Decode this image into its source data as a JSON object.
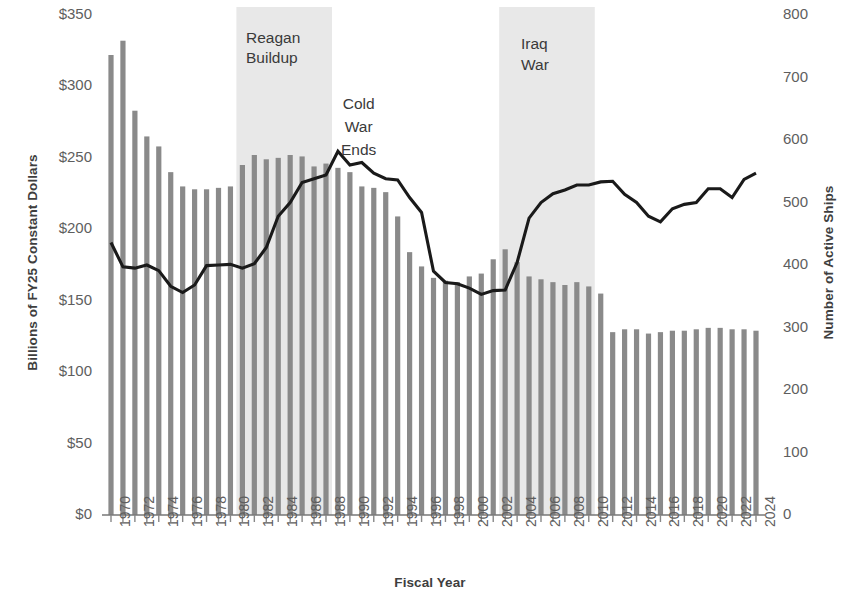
{
  "chart_data": {
    "type": "bar",
    "title": "",
    "xlabel": "Fiscal Year",
    "ylabel": "Billions of FY25 Constant Dollars",
    "ylabel_right": "Number of Active Ships",
    "ylim": [
      0,
      350
    ],
    "ylim_right": [
      0,
      800
    ],
    "ytick_labels": [
      "$0",
      "$50",
      "$100",
      "$150",
      "$200",
      "$250",
      "$300",
      "$350"
    ],
    "ytick_values": [
      0,
      50,
      100,
      150,
      200,
      250,
      300,
      350
    ],
    "ytick_right_labels": [
      "0",
      "100",
      "200",
      "300",
      "400",
      "500",
      "600",
      "700",
      "800"
    ],
    "ytick_right_values": [
      0,
      100,
      200,
      300,
      400,
      500,
      600,
      700,
      800
    ],
    "grid": false,
    "legend_position": "none",
    "categories": [
      1970,
      1971,
      1972,
      1973,
      1974,
      1975,
      1976,
      1977,
      1978,
      1979,
      1980,
      1981,
      1982,
      1983,
      1984,
      1985,
      1986,
      1987,
      1988,
      1989,
      1990,
      1991,
      1992,
      1993,
      1994,
      1995,
      1996,
      1997,
      1998,
      1999,
      2000,
      2001,
      2002,
      2003,
      2004,
      2005,
      2006,
      2007,
      2008,
      2009,
      2010,
      2011,
      2012,
      2013,
      2014,
      2015,
      2016,
      2017,
      2018,
      2019,
      2020,
      2021,
      2022,
      2023,
      2024
    ],
    "xtick_labels": [
      "1970",
      "1972",
      "1974",
      "1976",
      "1978",
      "1980",
      "1982",
      "1984",
      "1986",
      "1988",
      "1990",
      "1992",
      "1994",
      "1996",
      "1998",
      "2000",
      "2002",
      "2004",
      "2006",
      "2008",
      "2010",
      "2012",
      "2014",
      "2016",
      "2018",
      "2020",
      "2022",
      "2024"
    ],
    "series": [
      {
        "name": "Budget",
        "type": "bar",
        "axis": "left",
        "unit": "Billions of FY25 Constant Dollars",
        "color": "#8a8a8a",
        "values": [
          322,
          332,
          283,
          265,
          258,
          240,
          230,
          228,
          228,
          229,
          230,
          245,
          252,
          249,
          250,
          252,
          251,
          244,
          246,
          243,
          240,
          230,
          229,
          226,
          209,
          184,
          174,
          166,
          164,
          163,
          167,
          169,
          179,
          186,
          177,
          167,
          165,
          163,
          161,
          163,
          160,
          155,
          128,
          130,
          130,
          127,
          128,
          129,
          129,
          130,
          131,
          131,
          130,
          130,
          129
        ]
      },
      {
        "name": "Active Ships",
        "type": "line",
        "axis": "right",
        "unit": "Number of Active Ships",
        "color": "#1a1a1a",
        "values": [
          436,
          397,
          395,
          400,
          391,
          366,
          356,
          368,
          399,
          400,
          401,
          395,
          402,
          428,
          478,
          500,
          532,
          538,
          544,
          582,
          560,
          564,
          547,
          538,
          536,
          508,
          484,
          390,
          372,
          370,
          363,
          353,
          359,
          360,
          404,
          475,
          500,
          514,
          520,
          528,
          528,
          533,
          534,
          513,
          500,
          478,
          469,
          490,
          497,
          500,
          522,
          522,
          508,
          537,
          547
        ]
      }
    ],
    "annotations": [
      {
        "name": "reagan-buildup",
        "text_lines": [
          "Reagan",
          "Buildup"
        ],
        "band_start": 1981,
        "band_end": 1988,
        "shaded": true
      },
      {
        "name": "cold-war-ends",
        "text_lines": [
          "Cold",
          "War",
          "Ends"
        ],
        "shaded": false
      },
      {
        "name": "iraq-war",
        "text_lines": [
          "Iraq",
          "War"
        ],
        "band_start": 2003,
        "band_end": 2010,
        "shaded": true
      }
    ],
    "band_color": "#e8e8e8"
  },
  "annotation_text": {
    "reagan_line1": "Reagan",
    "reagan_line2": "Buildup",
    "coldwar_line1": "Cold",
    "coldwar_line2": "War",
    "coldwar_line3": "Ends",
    "iraq_line1": "Iraq",
    "iraq_line2": "War"
  }
}
